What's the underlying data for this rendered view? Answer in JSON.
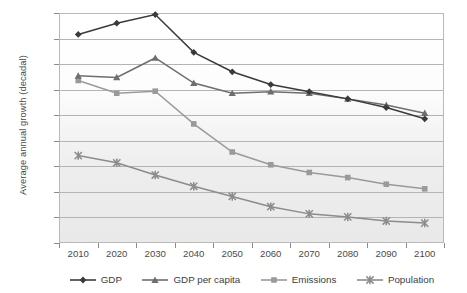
{
  "chart_data": {
    "type": "line",
    "title": "",
    "xlabel": "",
    "ylabel": "Average annual growth (decadal)",
    "categories": [
      "2010",
      "2020",
      "2030",
      "2040",
      "2050",
      "2060",
      "2070",
      "2080",
      "2090",
      "2100"
    ],
    "x": [
      2010,
      2020,
      2030,
      2040,
      2050,
      2060,
      2070,
      2080,
      2090,
      2100
    ],
    "ylim": [
      -0.5,
      4.0
    ],
    "ytick_labels": [
      "4.0%",
      "3.5%",
      "3.0%",
      "2.5%",
      "2.0%",
      "1.5%",
      "1.0%",
      "0.5%",
      "0.0%",
      "-0.5%"
    ],
    "ytick_values": [
      4.0,
      3.5,
      3.0,
      2.5,
      2.0,
      1.5,
      1.0,
      0.5,
      0.0,
      -0.5
    ],
    "unit": "%",
    "grid": "horizontal",
    "legend_position": "bottom",
    "series": [
      {
        "name": "GDP",
        "marker": "diamond",
        "color": "#3a3a3a",
        "values": [
          3.58,
          3.8,
          3.97,
          3.23,
          2.85,
          2.6,
          2.46,
          2.32,
          2.15,
          1.93
        ]
      },
      {
        "name": "GDP per capita",
        "marker": "triangle",
        "color": "#6e6e6e",
        "values": [
          2.77,
          2.74,
          3.12,
          2.63,
          2.43,
          2.46,
          2.43,
          2.32,
          2.2,
          2.04
        ]
      },
      {
        "name": "Emissions",
        "marker": "square",
        "color": "#9a9a9a",
        "values": [
          2.68,
          2.43,
          2.47,
          1.83,
          1.28,
          1.03,
          0.88,
          0.78,
          0.65,
          0.56
        ]
      },
      {
        "name": "Population",
        "marker": "cross",
        "color": "#8c8c8c",
        "values": [
          1.21,
          1.07,
          0.83,
          0.61,
          0.41,
          0.21,
          0.07,
          0.01,
          -0.07,
          -0.11
        ]
      }
    ]
  },
  "legend": {
    "items": [
      {
        "label": "GDP"
      },
      {
        "label": "GDP per capita"
      },
      {
        "label": "Emissions"
      },
      {
        "label": "Population"
      }
    ]
  },
  "axes": {
    "y_title": "Average annual growth (decadal)"
  }
}
